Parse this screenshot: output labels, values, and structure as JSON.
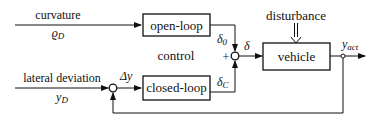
{
  "diagram": {
    "type": "block-diagram",
    "blocks": {
      "open_loop": {
        "label": "open-loop"
      },
      "closed_loop": {
        "label": "closed-loop"
      },
      "vehicle": {
        "label": "vehicle"
      }
    },
    "inputs": {
      "curvature": {
        "label": "curvature",
        "symbol": "ϱ",
        "subscript": "D"
      },
      "lateral_deviation": {
        "label": "lateral deviation",
        "symbol": "y",
        "subscript": "D"
      }
    },
    "signals": {
      "delta_0": {
        "symbol": "δ",
        "subscript": "0"
      },
      "delta_c": {
        "symbol": "δ",
        "subscript": "C"
      },
      "delta": {
        "symbol": "δ"
      },
      "delta_y": {
        "symbol": "Δy"
      },
      "y_act": {
        "symbol": "y",
        "subscript": "act"
      }
    },
    "annotations": {
      "disturbance": "disturbance",
      "control": "control",
      "plus_sign": "+"
    }
  }
}
